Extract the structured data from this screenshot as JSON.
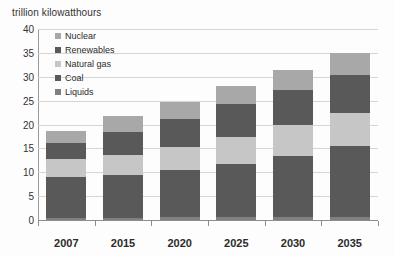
{
  "chart_data": {
    "type": "bar",
    "stacked": true,
    "title": "trillion kilowatthours",
    "xlabel": "",
    "ylabel": "trillion kilowatthours",
    "ylim": [
      0,
      40
    ],
    "ytick_step": 5,
    "yticks": [
      "40",
      "35",
      "30",
      "25",
      "20",
      "15",
      "10",
      "5",
      "0"
    ],
    "grid": true,
    "legend_position": "inside-top-left",
    "categories": [
      "2007",
      "2015",
      "2020",
      "2025",
      "2030",
      "2035"
    ],
    "series": [
      {
        "name": "Liquids",
        "color": "#808080",
        "values": [
          0.5,
          0.5,
          0.7,
          0.7,
          0.7,
          0.7
        ]
      },
      {
        "name": "Coal",
        "color": "#595959",
        "values": [
          8.5,
          9.0,
          9.8,
          11.1,
          12.8,
          14.9
        ]
      },
      {
        "name": "Natural gas",
        "color": "#c6c6c6",
        "values": [
          3.7,
          4.2,
          4.8,
          5.6,
          6.3,
          6.9
        ]
      },
      {
        "name": "Renewables",
        "color": "#595959",
        "values": [
          3.4,
          4.8,
          5.8,
          6.8,
          7.4,
          7.8
        ]
      },
      {
        "name": "Nuclear",
        "color": "#a8a8a8",
        "values": [
          2.5,
          3.3,
          3.6,
          3.9,
          4.2,
          4.6
        ]
      }
    ],
    "cumulative_tops": {
      "2007": [
        0.5,
        9.0,
        12.7,
        16.1,
        18.6
      ],
      "2015": [
        0.5,
        9.5,
        13.7,
        18.5,
        21.8
      ],
      "2020": [
        0.7,
        10.5,
        15.3,
        21.1,
        24.7
      ],
      "2025": [
        0.7,
        11.8,
        17.4,
        24.2,
        28.1
      ],
      "2030": [
        0.7,
        13.5,
        19.8,
        27.2,
        31.4
      ],
      "2035": [
        0.7,
        15.6,
        22.5,
        30.3,
        34.9
      ]
    },
    "totals": [
      18.6,
      21.8,
      24.7,
      28.1,
      31.4,
      34.9
    ]
  },
  "legend": {
    "items": [
      {
        "label": "Nuclear",
        "color": "#a8a8a8"
      },
      {
        "label": "Renewables",
        "color": "#595959"
      },
      {
        "label": "Natural gas",
        "color": "#c6c6c6"
      },
      {
        "label": "Coal",
        "color": "#595959"
      },
      {
        "label": "Liquids",
        "color": "#808080"
      }
    ]
  },
  "colors": {
    "grid": "#d5d5d5",
    "axis": "#8d8d8d",
    "text": "#2b2b2b",
    "background": "#ffffff"
  }
}
